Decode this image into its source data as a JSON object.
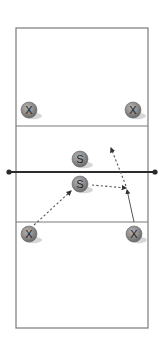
{
  "diagram": {
    "type": "volleyball-court-drill",
    "colors": {
      "court_line": "#7a7a7a",
      "net": "#2b2b2b",
      "player_fill": "#8a8a8a",
      "player_shadow": "#d6d6d6",
      "arrow": "#555555"
    },
    "court": {
      "outer": {
        "x": 16,
        "y": 28,
        "width": 132,
        "height": 300
      },
      "attack_line_top_y": 126,
      "attack_line_bottom_y": 222,
      "net": {
        "y": 172,
        "x1": 9,
        "x2": 155
      }
    },
    "players": [
      {
        "id": "x-top-left",
        "label": "X",
        "cx": 29,
        "cy": 110
      },
      {
        "id": "x-top-right",
        "label": "X",
        "cx": 133,
        "cy": 110
      },
      {
        "id": "s-top",
        "label": "S",
        "cx": 80,
        "cy": 159
      },
      {
        "id": "s-bottom",
        "label": "S",
        "cx": 80,
        "cy": 184
      },
      {
        "id": "x-bottom-left",
        "label": "X",
        "cx": 29,
        "cy": 234
      },
      {
        "id": "x-bottom-right",
        "label": "X",
        "cx": 134,
        "cy": 234
      }
    ],
    "arrows": [
      {
        "id": "pass-to-setter",
        "style": "dotted",
        "x1": 34,
        "y1": 225,
        "x2": 71,
        "y2": 191
      },
      {
        "id": "set-to-hitter",
        "style": "dotted",
        "x1": 92,
        "y1": 185,
        "x2": 126,
        "y2": 188
      },
      {
        "id": "hitter-approach",
        "style": "solid",
        "x1": 134,
        "y1": 222,
        "x2": 127,
        "y2": 190
      },
      {
        "id": "attack-over-net",
        "style": "dotted",
        "x1": 126,
        "y1": 186,
        "x2": 111,
        "y2": 148
      }
    ]
  }
}
